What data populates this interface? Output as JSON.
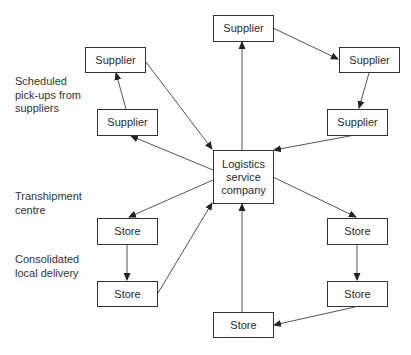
{
  "diagram": {
    "labels": {
      "pickups": "Scheduled pick-ups from suppliers",
      "pickups_lines": [
        "Scheduled",
        "pick-ups from",
        "suppliers"
      ],
      "tranship_lines": [
        "Transhipment",
        "centre"
      ],
      "local_lines": [
        "Consolidated",
        "local delivery"
      ]
    },
    "nodes": {
      "center": {
        "id": "center",
        "label_lines": [
          "Logistics",
          "service",
          "company"
        ]
      },
      "sup_top": {
        "id": "sup_top",
        "label": "Supplier"
      },
      "sup_topright": {
        "id": "sup_topright",
        "label": "Supplier"
      },
      "sup_midright": {
        "id": "sup_midright",
        "label": "Supplier"
      },
      "sup_topleft": {
        "id": "sup_topleft",
        "label": "Supplier"
      },
      "sup_midleft": {
        "id": "sup_midleft",
        "label": "Supplier"
      },
      "store_right1": {
        "id": "store_right1",
        "label": "Store"
      },
      "store_right2": {
        "id": "store_right2",
        "label": "Store"
      },
      "store_bottom": {
        "id": "store_bottom",
        "label": "Store"
      },
      "store_left1": {
        "id": "store_left1",
        "label": "Store"
      },
      "store_left2": {
        "id": "store_left2",
        "label": "Store"
      }
    },
    "edges": [
      {
        "from": "center",
        "to": "sup_top"
      },
      {
        "from": "sup_top",
        "to": "sup_topright"
      },
      {
        "from": "sup_topright",
        "to": "sup_midright"
      },
      {
        "from": "sup_midright",
        "to": "center"
      },
      {
        "from": "center",
        "to": "sup_midleft"
      },
      {
        "from": "sup_midleft",
        "to": "sup_topleft"
      },
      {
        "from": "sup_topleft",
        "to": "center"
      },
      {
        "from": "center",
        "to": "store_left1"
      },
      {
        "from": "store_left1",
        "to": "store_left2"
      },
      {
        "from": "store_left2",
        "to": "center"
      },
      {
        "from": "center",
        "to": "store_right1"
      },
      {
        "from": "store_right1",
        "to": "store_right2"
      },
      {
        "from": "store_right2",
        "to": "store_bottom"
      },
      {
        "from": "store_bottom",
        "to": "center"
      }
    ]
  }
}
